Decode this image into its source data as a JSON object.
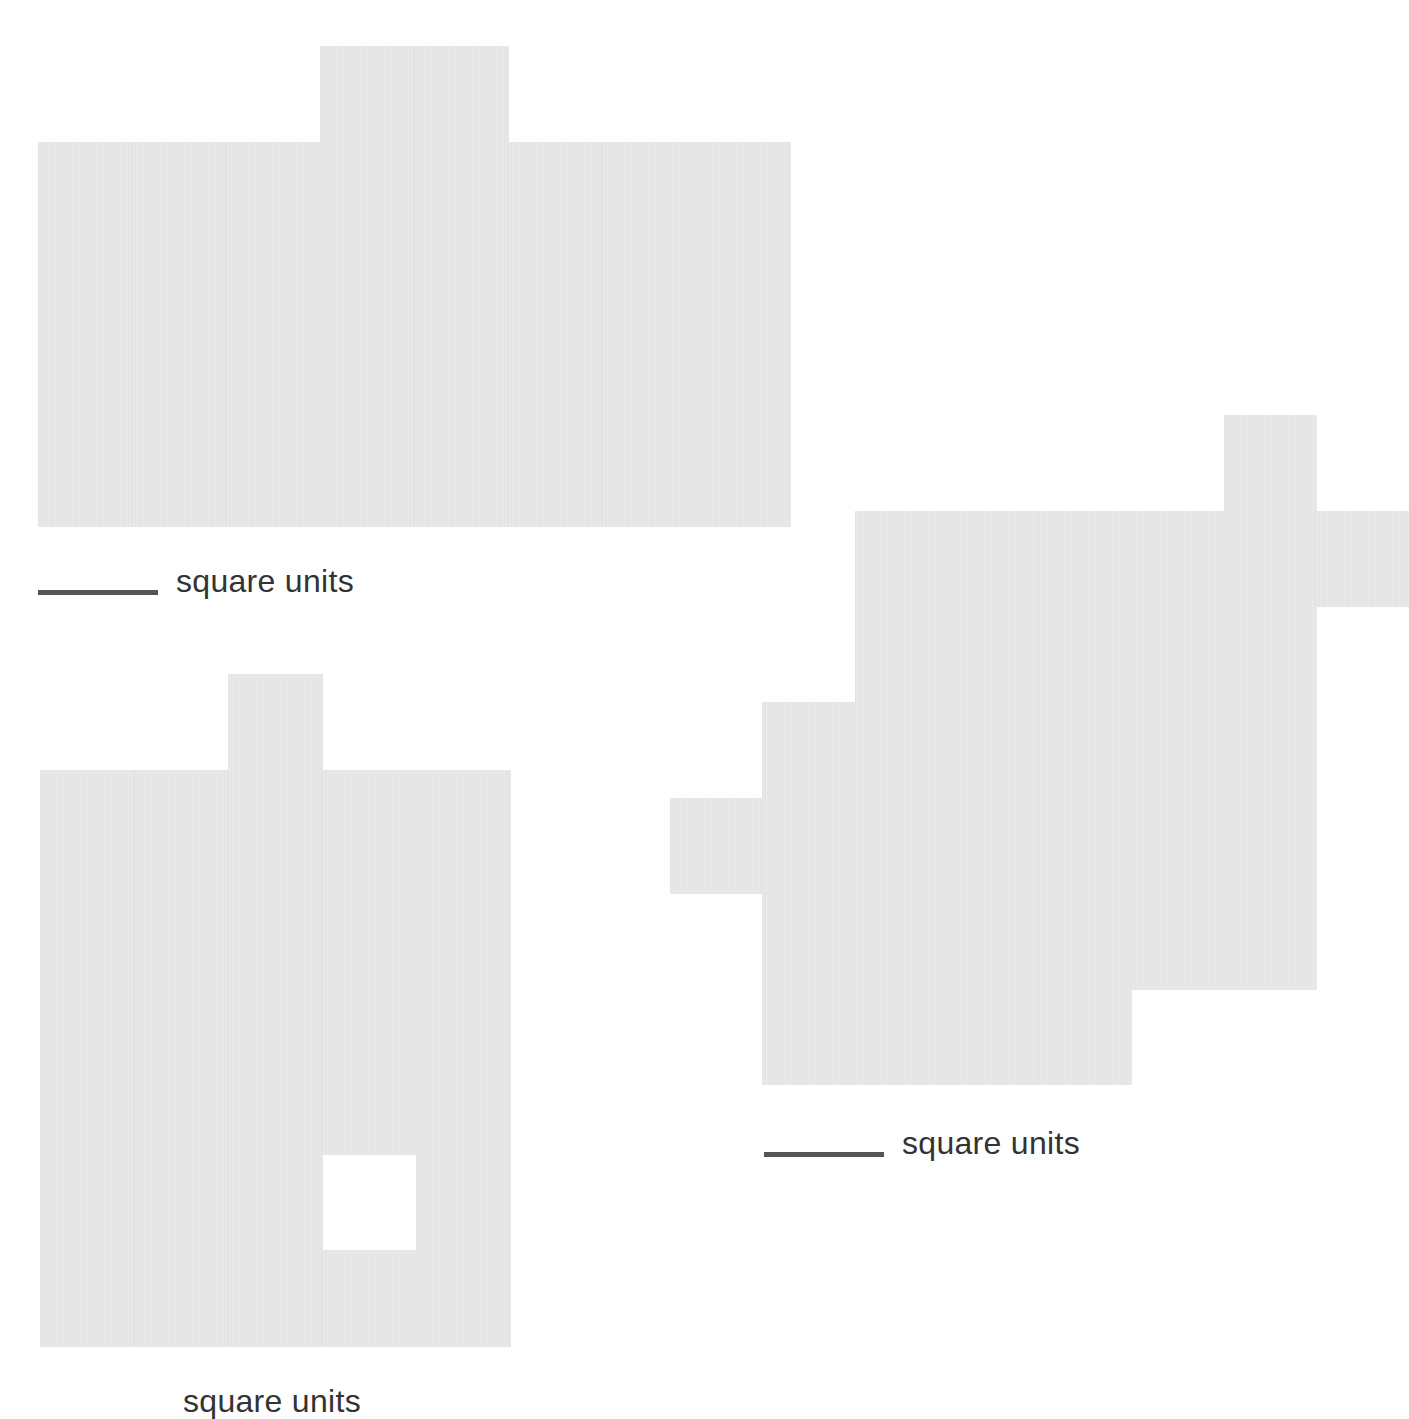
{
  "figures": [
    {
      "id": "shape-a",
      "origin": [
        38,
        46
      ],
      "unit": [
        94,
        96
      ],
      "rows": [
        [
          3,
          4
        ],
        [
          0,
          7
        ],
        [
          0,
          7
        ],
        [
          0,
          7
        ],
        [
          0,
          7
        ]
      ],
      "holes": [],
      "answer": {
        "blank": true,
        "label": "square units",
        "pos": [
          38,
          565
        ]
      }
    },
    {
      "id": "shape-b",
      "origin": [
        40,
        674
      ],
      "unit": [
        94,
        96
      ],
      "rows": [
        [
          2,
          2
        ],
        [
          0,
          4
        ],
        [
          0,
          4
        ],
        [
          0,
          4
        ],
        [
          0,
          4
        ],
        [
          0,
          4
        ],
        [
          0,
          4
        ]
      ],
      "holes": [
        [
          3,
          5
        ]
      ],
      "answer": {
        "blank": false,
        "label": "square units",
        "pos": [
          183,
          1385
        ]
      }
    },
    {
      "id": "shape-c",
      "origin": [
        670,
        415
      ],
      "unit": [
        92.3,
        95.7
      ],
      "rows": [
        [
          6,
          6
        ],
        [
          2,
          7
        ],
        [
          2,
          6
        ],
        [
          1,
          6
        ],
        [
          0,
          6
        ],
        [
          1,
          6
        ],
        [
          1,
          4
        ]
      ],
      "holes": [],
      "answer": {
        "blank": true,
        "label": "square units",
        "pos": [
          764,
          1127
        ]
      }
    }
  ],
  "colors": {
    "shape_fill": "#e8e8e8",
    "blank_line": "#555555",
    "text": "#333333"
  }
}
